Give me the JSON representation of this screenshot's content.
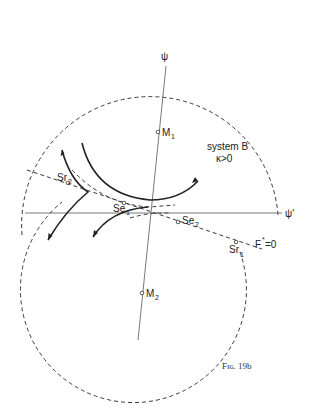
{
  "figure": {
    "caption": "Fig. 19b",
    "caption_display": "Fɪɢ. 19b",
    "system_label": "system B",
    "condition_label": "κ>0",
    "axes": {
      "psi": "ψ",
      "psi_prime": "ψ'"
    },
    "points": {
      "M1": {
        "main": "M",
        "sub": "1"
      },
      "M2": {
        "main": "M",
        "sub": "2"
      },
      "Se1": {
        "main": "Se",
        "sub": "1"
      },
      "Se2": {
        "main": "Se",
        "sub": "2"
      },
      "Sr1": {
        "main": "Sr",
        "sub": "1"
      },
      "Sr2": {
        "main": "Sr",
        "sub": "2"
      }
    },
    "line_label": "F*=0",
    "line_label_main": "F",
    "line_label_sup": "*",
    "line_label_rest": "=0",
    "colors": {
      "ink": "#222222",
      "background": "#ffffff"
    }
  }
}
